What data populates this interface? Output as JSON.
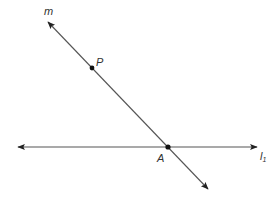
{
  "diagram": {
    "colors": {
      "line": "#555555",
      "point": "#111111",
      "text": "#333333",
      "background": "#ffffff"
    },
    "lines": [
      {
        "name": "m",
        "label": "m",
        "x1": 48,
        "y1": 22,
        "x2": 208,
        "y2": 189,
        "arrows": "both"
      },
      {
        "name": "l1",
        "label": "l",
        "subscript": "1",
        "x1": 18,
        "y1": 147,
        "x2": 257,
        "y2": 147,
        "arrows": "both"
      }
    ],
    "points": [
      {
        "name": "P",
        "label": "P",
        "x": 92,
        "y": 68
      },
      {
        "name": "A",
        "label": "A",
        "x": 168,
        "y": 147
      }
    ],
    "labels": {
      "m": "m",
      "P": "P",
      "A": "A",
      "l1_main": "l",
      "l1_sub": "1"
    }
  }
}
